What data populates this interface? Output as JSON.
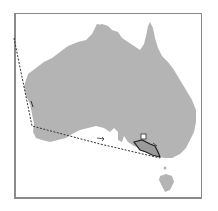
{
  "map": {
    "region": "Australia",
    "colors": {
      "background": "#ffffff",
      "land": "#b4b4b4",
      "frame": "#8a8a8a",
      "route": "#333333",
      "home_range_outline": "#222222",
      "home_range_fill": "#9a9a9a",
      "marker": "#ffffff"
    },
    "features": {
      "route": {
        "style": "dashed",
        "description": "migration track from north-west offshore to south-west coast, then east to south-east"
      },
      "home_range": {
        "style": "solid-outline polygon",
        "location": "south-eastern Australia"
      },
      "marker": {
        "shape": "square",
        "location": "above home range"
      },
      "direction_arrows": [
        "south along west coast",
        "east along south coast",
        "north-east along home range"
      ]
    }
  }
}
